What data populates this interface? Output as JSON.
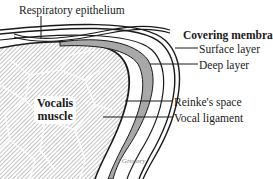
{
  "diagram": {
    "labels": {
      "respiratory_epithelium": "Respiratory epithelium",
      "covering_membrane": "Covering membrane:",
      "surface_layer": "Surface layer",
      "deep_layer": "Deep layer",
      "reinkes_space": "Reinke's space",
      "vocal_ligament": "Vocal ligament",
      "vocalis_line1": "Vocalis",
      "vocalis_line2": "muscle",
      "credit": "J Gregory"
    },
    "colors": {
      "outline": "#1a1a1a",
      "reinke_fill": "#a8a8a8",
      "muscle_hatch": "#8a8a8a",
      "background": "#ffffff"
    }
  }
}
